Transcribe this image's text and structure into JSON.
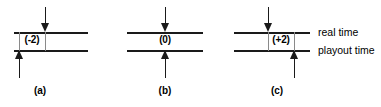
{
  "figure": {
    "width": 381,
    "height": 107,
    "background": "#ffffff",
    "line_color": "#1a1a1a",
    "guide_color": "#8a8a8a",
    "text_color": "#000000"
  },
  "axis_labels": {
    "real_time": "real time",
    "playout_time": "playout time"
  },
  "panels": [
    {
      "id": "a",
      "caption": "(a)",
      "offset_label": "(-2)",
      "offset_value": -2,
      "down_arrow": "down-arrow",
      "up_arrow": "up-arrow"
    },
    {
      "id": "b",
      "caption": "(b)",
      "offset_label": "(0)",
      "offset_value": 0,
      "down_arrow": "down-arrow",
      "up_arrow": "up-arrow"
    },
    {
      "id": "c",
      "caption": "(c)",
      "offset_label": "(+2)",
      "offset_value": 2,
      "down_arrow": "down-arrow",
      "up_arrow": "up-arrow"
    }
  ]
}
